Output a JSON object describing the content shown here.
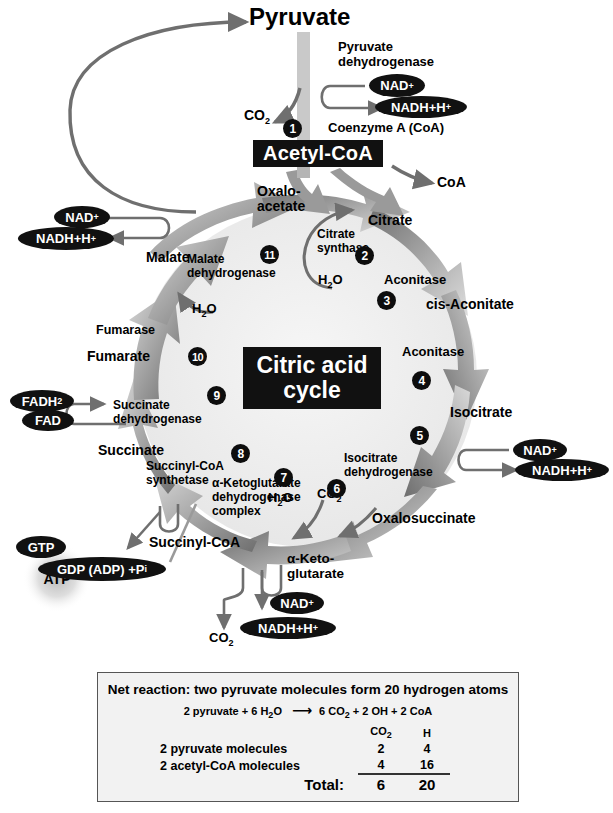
{
  "figure": {
    "title": "Citric acid cycle",
    "center_line1": "Citric acid",
    "center_line2": "cycle"
  },
  "molecules": {
    "pyruvate": "Pyruvate",
    "acetyl_coa": "Acetyl-CoA",
    "coa_out": "CoA",
    "coenzyme_a": "Coenzyme A (CoA)",
    "oxalo_1": "Oxalo-",
    "oxalo_2": "acetate",
    "citrate": "Citrate",
    "cis_aconitate": "cis-Aconitate",
    "isocitrate": "Isocitrate",
    "oxalosuccinate": "Oxalosuccinate",
    "alpha_keto_1": "α-Keto-",
    "alpha_keto_2": "glutarate",
    "succinyl_coa": "Succinyl-CoA",
    "succinate": "Succinate",
    "fumarate": "Fumarate",
    "malate": "Malate"
  },
  "enzymes": {
    "pyruvate_dh_1": "Pyruvate",
    "pyruvate_dh_2": "dehydrogenase",
    "citrate_synthase_1": "Citrate",
    "citrate_synthase_2": "synthase",
    "aconitase_a": "Aconitase",
    "aconitase_b": "Aconitase",
    "isocitrate_dh_1": "Isocitrate",
    "isocitrate_dh_2": "dehydrogenase",
    "akg_dh_1": "α-Ketoglutarate",
    "akg_dh_2": "dehydrogenase",
    "akg_dh_3": "complex",
    "succinyl_coa_syn_1": "Succinyl-CoA",
    "succinyl_coa_syn_2": "synthetase",
    "succinate_dh_1": "Succinate",
    "succinate_dh_2": "dehydrogenase",
    "fumarase": "Fumarase",
    "malate_dh_1": "Malate",
    "malate_dh_2": "dehydrogenase"
  },
  "cofactors": {
    "nad_top": "NAD",
    "nadh_top": "NADH+H",
    "nad_right": "NAD",
    "nadh_right": "NADH+H",
    "nad_bottom": "NAD",
    "nadh_bottom": "NADH+H",
    "nad_left": "NAD",
    "nadh_left": "NADH+H",
    "fadh2": "FADH",
    "fadh2_sub": "2",
    "fad": "FAD",
    "gtp": "GTP",
    "gdp": "GDP (ADP) +P",
    "gdp_sub": "i",
    "atp": "ATP",
    "plus": "+"
  },
  "small_molecules": {
    "co2_top": "CO",
    "co2_mid": "CO",
    "co2_bottom": "CO",
    "h2o_citrate": "H",
    "h2o_akg": "H",
    "h2o_fumarase": "H",
    "sub_2": "2",
    "o": "O"
  },
  "steps": [
    {
      "n": "1",
      "label": "step-1-pyruvate-dehydrogenase"
    },
    {
      "n": "2",
      "label": "step-2-citrate-synthase"
    },
    {
      "n": "3",
      "label": "step-3-aconitase"
    },
    {
      "n": "4",
      "label": "step-4-aconitase"
    },
    {
      "n": "5",
      "label": "step-5-isocitrate-dehydrogenase"
    },
    {
      "n": "6",
      "label": "step-6-decarboxylation"
    },
    {
      "n": "7",
      "label": "step-7-akg-dehydrogenase"
    },
    {
      "n": "8",
      "label": "step-8-succinyl-coa-synthetase"
    },
    {
      "n": "9",
      "label": "step-9-succinate-dehydrogenase"
    },
    {
      "n": "10",
      "label": "step-10-fumarase"
    },
    {
      "n": "11",
      "label": "step-11-malate-dehydrogenase"
    }
  ],
  "net_reaction": {
    "title": "Net reaction: two pyruvate molecules form 20 hydrogen atoms",
    "equation_left": "2 pyruvate + 6 H",
    "equation_left_sub": "2",
    "equation_left_tail": "O",
    "equation_arrow": "⟶",
    "equation_right": "6 CO",
    "equation_right_sub": "2",
    "equation_right_tail": " + 2 OH + 2 CoA",
    "col_header_co2": "CO",
    "col_header_co2_sub": "2",
    "col_header_h": "H",
    "rows": [
      {
        "name": "2 pyruvate molecules",
        "co2": "2",
        "h": "4"
      },
      {
        "name": "2 acetyl-CoA molecules",
        "co2": "4",
        "h": "16"
      }
    ],
    "total_label": "Total:",
    "total_co2": "6",
    "total_h": "20"
  },
  "colors": {
    "arrow_dark": "#6b6b6b",
    "arrow_light": "#d8d8d8",
    "chip_black": "#111111",
    "plate_black": "#111111",
    "box_fill": "#f2f2f2",
    "box_border": "#555555",
    "cycle_fill": "#f0f0f0"
  }
}
